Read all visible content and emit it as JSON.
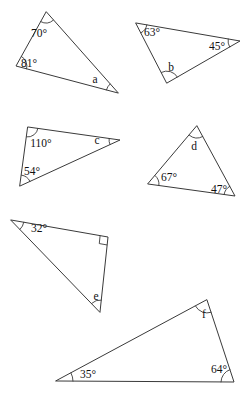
{
  "page": {
    "background_color": "#ffffff",
    "stroke_color": "#3a3a3a",
    "text_color": "#111111",
    "width": 246,
    "height": 395
  },
  "figures": [
    {
      "id": "triangle-1",
      "vertices": [
        [
          46,
          12
        ],
        [
          16,
          66
        ],
        [
          118,
          93
        ]
      ],
      "angles": [
        {
          "name": "angle-70",
          "label": "70°",
          "value": 70,
          "known": true,
          "vertex": [
            46,
            12
          ],
          "label_pos": [
            39,
            34
          ],
          "arc_radius": 11
        },
        {
          "name": "angle-81",
          "label": "81°",
          "value": 81,
          "known": true,
          "vertex": [
            16,
            66
          ],
          "label_pos": [
            29,
            64
          ],
          "arc_radius": 11
        },
        {
          "name": "angle-a",
          "label": "a",
          "value": null,
          "known": false,
          "vertex": [
            118,
            93
          ],
          "label_pos": [
            95,
            80
          ],
          "arc_radius": 12
        }
      ]
    },
    {
      "id": "triangle-2",
      "vertices": [
        [
          136,
          23
        ],
        [
          240,
          41
        ],
        [
          167,
          83
        ]
      ],
      "angles": [
        {
          "name": "angle-63",
          "label": "63°",
          "value": 63,
          "known": true,
          "vertex": [
            136,
            23
          ],
          "label_pos": [
            152,
            33
          ],
          "arc_radius": 11
        },
        {
          "name": "angle-45",
          "label": "45°",
          "value": 45,
          "known": true,
          "vertex": [
            240,
            41
          ],
          "label_pos": [
            217,
            47
          ],
          "arc_radius": 12
        },
        {
          "name": "angle-b",
          "label": "b",
          "value": null,
          "known": false,
          "vertex": [
            167,
            83
          ],
          "label_pos": [
            171,
            68
          ],
          "arc_radius": 12
        }
      ]
    },
    {
      "id": "triangle-3",
      "vertices": [
        [
          28,
          127
        ],
        [
          120,
          140
        ],
        [
          20,
          186
        ]
      ],
      "angles": [
        {
          "name": "angle-110",
          "label": "110°",
          "value": 110,
          "known": true,
          "vertex": [
            28,
            127
          ],
          "label_pos": [
            41,
            144
          ],
          "arc_radius": 10
        },
        {
          "name": "angle-c",
          "label": "c",
          "value": null,
          "known": false,
          "vertex": [
            120,
            140
          ],
          "label_pos": [
            97,
            141
          ],
          "arc_radius": 11
        },
        {
          "name": "angle-54",
          "label": "54°",
          "value": 54,
          "known": true,
          "vertex": [
            20,
            186
          ],
          "label_pos": [
            32,
            172
          ],
          "arc_radius": 11
        }
      ]
    },
    {
      "id": "triangle-4",
      "vertices": [
        [
          197,
          126
        ],
        [
          235,
          196
        ],
        [
          148,
          184
        ]
      ],
      "angles": [
        {
          "name": "angle-d",
          "label": "d",
          "value": null,
          "known": false,
          "vertex": [
            197,
            126
          ],
          "label_pos": [
            194,
            147
          ],
          "arc_radius": 12
        },
        {
          "name": "angle-47",
          "label": "47°",
          "value": 47,
          "known": true,
          "vertex": [
            235,
            196
          ],
          "label_pos": [
            219,
            190
          ],
          "arc_radius": 11
        },
        {
          "name": "angle-67",
          "label": "67°",
          "value": 67,
          "known": true,
          "vertex": [
            148,
            184
          ],
          "label_pos": [
            169,
            178
          ],
          "arc_radius": 11
        }
      ]
    },
    {
      "id": "triangle-5",
      "vertices": [
        [
          11,
          220
        ],
        [
          108,
          237
        ],
        [
          100,
          312
        ]
      ],
      "angles": [
        {
          "name": "angle-32",
          "label": "32°",
          "value": 32,
          "known": true,
          "vertex": [
            11,
            220
          ],
          "label_pos": [
            39,
            229
          ],
          "arc_radius": 13
        },
        {
          "name": "angle-right",
          "label": "",
          "value": 90,
          "known": true,
          "vertex": [
            108,
            237
          ],
          "label_pos": [
            0,
            0
          ],
          "arc_radius": 0,
          "right_angle": true
        },
        {
          "name": "angle-e",
          "label": "e",
          "value": null,
          "known": false,
          "vertex": [
            100,
            312
          ],
          "label_pos": [
            96,
            297
          ],
          "arc_radius": 12
        }
      ]
    },
    {
      "id": "triangle-6",
      "vertices": [
        [
          207,
          300
        ],
        [
          234,
          382
        ],
        [
          56,
          381
        ]
      ],
      "angles": [
        {
          "name": "angle-f",
          "label": "f",
          "value": null,
          "known": false,
          "vertex": [
            207,
            300
          ],
          "label_pos": [
            204,
            315
          ],
          "arc_radius": 13
        },
        {
          "name": "angle-64",
          "label": "64°",
          "value": 64,
          "known": true,
          "vertex": [
            234,
            382
          ],
          "label_pos": [
            219,
            370
          ],
          "arc_radius": 13
        },
        {
          "name": "angle-35",
          "label": "35°",
          "value": 35,
          "known": true,
          "vertex": [
            56,
            381
          ],
          "label_pos": [
            88,
            375
          ],
          "arc_radius": 17
        }
      ]
    }
  ]
}
